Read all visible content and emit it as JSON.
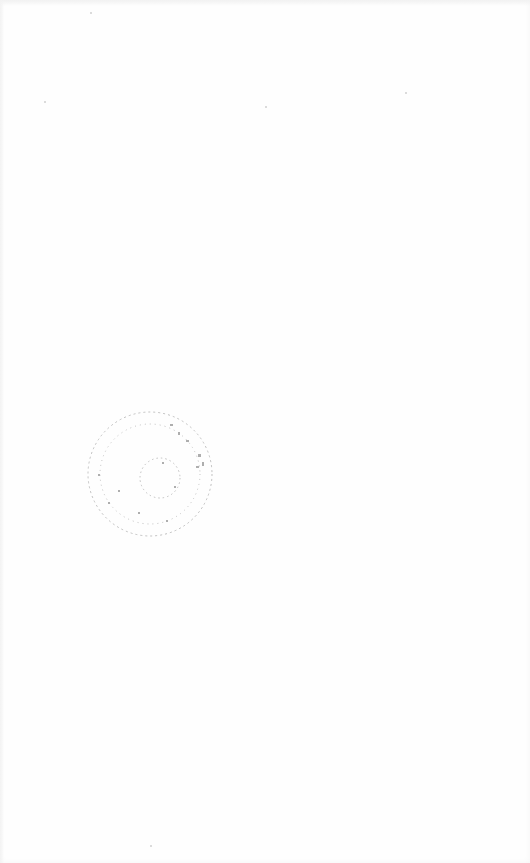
{
  "document": {
    "type": "scanned blank page",
    "stamp": {
      "shape": "circular seal",
      "legibility": "illegible",
      "color": "#7a7a7a"
    }
  }
}
